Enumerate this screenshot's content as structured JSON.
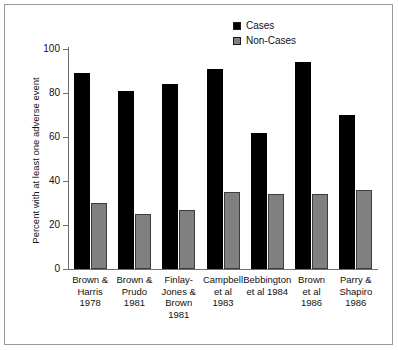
{
  "chart_data": {
    "type": "bar",
    "title": "",
    "xlabel": "",
    "ylabel": "Percent with at least one adverse event",
    "ylim": [
      0,
      100
    ],
    "yticks": [
      0,
      20,
      40,
      60,
      80,
      100
    ],
    "grid": false,
    "legend_position": "top-center-right",
    "categories": [
      "Brown & Harris 1978",
      "Brown & Prudo 1981",
      "Finlay-Jones & Brown 1981",
      "Campbell et al 1983",
      "Bebbington et al 1984",
      "Brown et al 1986",
      "Parry & Shapiro 1986"
    ],
    "category_lines": [
      [
        "Brown &",
        "Harris",
        "1978"
      ],
      [
        "Brown &",
        "Prudo",
        "1981"
      ],
      [
        "Finlay-",
        "Jones &",
        "Brown",
        "1981"
      ],
      [
        "Campbell",
        "et al",
        "1983"
      ],
      [
        "Bebbington",
        "et al 1984"
      ],
      [
        "Brown",
        "et al",
        "1986"
      ],
      [
        "Parry &",
        "Shapiro",
        "1986"
      ]
    ],
    "series": [
      {
        "name": "Cases",
        "color": "#000000",
        "values": [
          89,
          81,
          84,
          91,
          62,
          94,
          70
        ]
      },
      {
        "name": "Non-Cases",
        "color": "#808080",
        "values": [
          30,
          25,
          27,
          35,
          34,
          34,
          36
        ]
      }
    ]
  },
  "legend": {
    "items": [
      {
        "label": "Cases",
        "color": "#000000"
      },
      {
        "label": "Non-Cases",
        "color": "#808080"
      }
    ]
  }
}
